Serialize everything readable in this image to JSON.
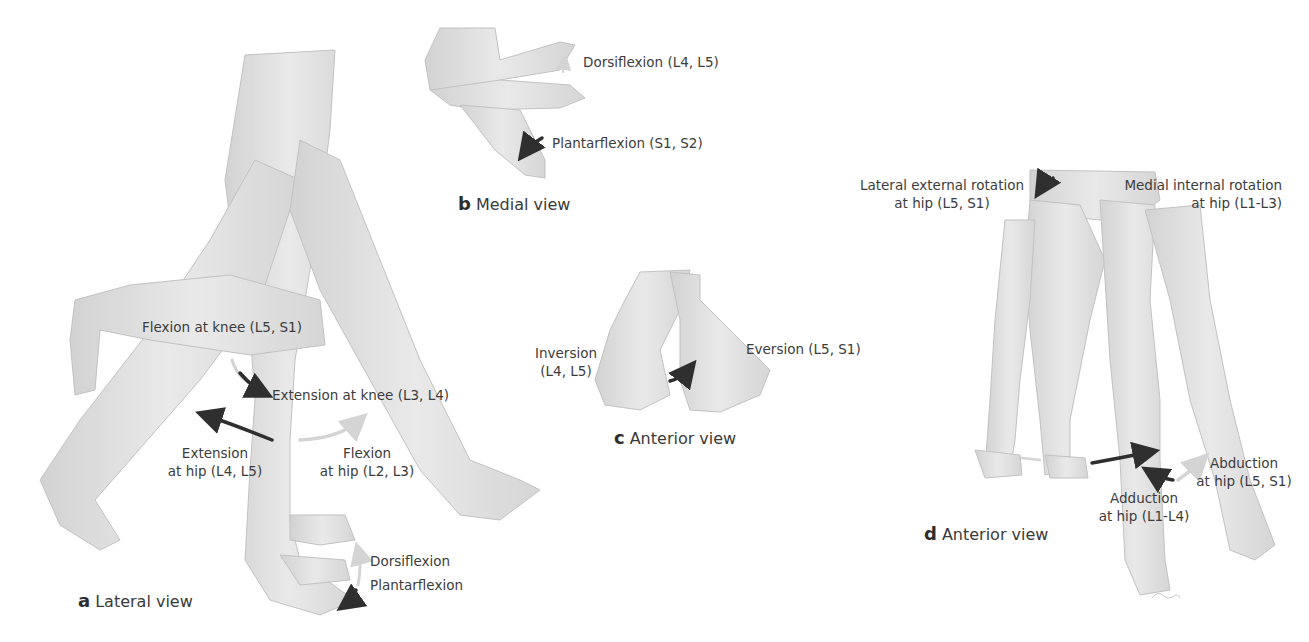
{
  "panels": {
    "a": {
      "letter": "a",
      "caption": "Lateral view",
      "labels": {
        "flexion_knee": "Flexion at knee (L5, S1)",
        "extension_knee": "Extension at knee (L3, L4)",
        "extension_hip_1": "Extension",
        "extension_hip_2": "at hip (L4, L5)",
        "flexion_hip_1": "Flexion",
        "flexion_hip_2": "at hip (L2, L3)",
        "dorsiflexion": "Dorsiflexion",
        "plantarflexion": "Plantarflexion"
      }
    },
    "b": {
      "letter": "b",
      "caption": "Medial view",
      "labels": {
        "dorsiflexion": "Dorsiflexion (L4, L5)",
        "plantarflexion": "Plantarflexion (S1, S2)"
      }
    },
    "c": {
      "letter": "c",
      "caption": "Anterior view",
      "labels": {
        "inversion_1": "Inversion",
        "inversion_2": "(L4, L5)",
        "eversion": "Eversion (L5, S1)"
      }
    },
    "d": {
      "letter": "d",
      "caption": "Anterior view",
      "labels": {
        "lateral_rotation_1": "Lateral external rotation",
        "lateral_rotation_2": "at hip (L5, S1)",
        "medial_rotation_1": "Medial internal rotation",
        "medial_rotation_2": "at hip (L1-L3)",
        "abduction_1": "Abduction",
        "abduction_2": "at hip (L5, S1)",
        "adduction_1": "Adduction",
        "adduction_2": "at hip (L1-L4)"
      }
    }
  },
  "colors": {
    "background": "#ffffff",
    "skin_light": "#e6e6e6",
    "skin_mid": "#cfcfcf",
    "outline": "#b5b5b5",
    "arrow_dark": "#2f2f2f",
    "arrow_light": "#d0d0d0",
    "text": "#3c3c3c"
  }
}
